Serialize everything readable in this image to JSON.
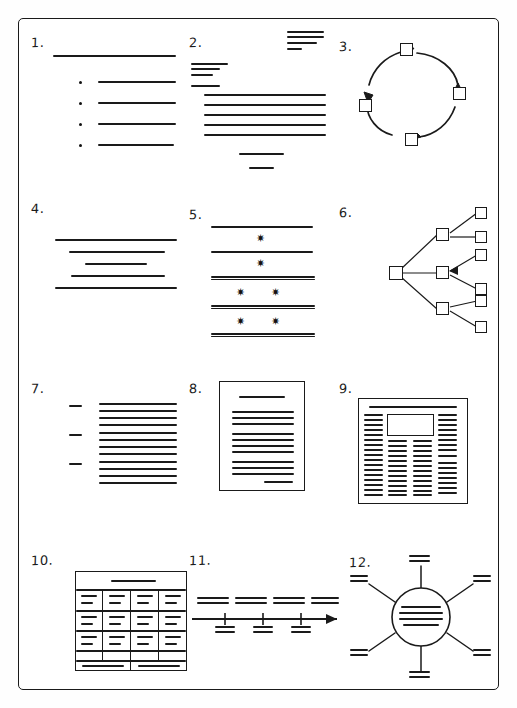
{
  "page": {
    "background_color": "#fefefe",
    "ink_color": "#1a1a1a",
    "frame": {
      "x": 18,
      "y": 18,
      "width": 481,
      "height": 672,
      "stroke": "#1a1a1a"
    }
  },
  "items": [
    {
      "id": 1,
      "number_label": "1.",
      "name": "bulleted-list-layout",
      "description": "Heading rule with four bulleted body lines",
      "bullet_count": 4
    },
    {
      "id": 2,
      "number_label": "2.",
      "name": "business-letter-layout",
      "description": "Letter with top-right address block, left sender block, body paragraph and closing signature lines",
      "top_right_lines": 4,
      "left_block_lines": 4,
      "body_lines": 5,
      "closing_lines": 2
    },
    {
      "id": 3,
      "number_label": "3.",
      "name": "cycle-diagram",
      "description": "Circular process cycle of four square nodes joined by curved arrows",
      "node_count": 4,
      "arrow_count": 4
    },
    {
      "id": 4,
      "number_label": "4.",
      "name": "centered-text-layout",
      "description": "Five centered lines of varying width forming an hourglass shape",
      "line_count": 5
    },
    {
      "id": 5,
      "number_label": "5.",
      "name": "starred-sections-layout",
      "description": "Horizontal divider rules separating rows marked with asterisk symbols",
      "divider_count": 5,
      "star_rows": [
        1,
        1,
        2,
        2
      ],
      "star_glyph": "✷"
    },
    {
      "id": 6,
      "number_label": "6.",
      "name": "tree-hierarchy-diagram",
      "description": "Root node branching to three middle nodes and six leaf nodes",
      "root_count": 1,
      "middle_count": 3,
      "leaf_count": 6
    },
    {
      "id": 7,
      "number_label": "7.",
      "name": "labeled-paragraph-layout",
      "description": "Three short side labels each aligned with a block of dense body text",
      "label_count": 3,
      "lines_per_block": 4
    },
    {
      "id": 8,
      "number_label": "8.",
      "name": "single-page-document",
      "description": "Bordered page with centered title, three paragraph blocks and a signature line at lower right",
      "paragraph_blocks": 3,
      "has_title_rule": true,
      "has_signature_rule": true
    },
    {
      "id": 9,
      "number_label": "9.",
      "name": "newspaper-layout",
      "description": "Masthead rule with a boxed image area and four dense text columns",
      "column_count": 4,
      "has_masthead": true,
      "has_image_box": true
    },
    {
      "id": 10,
      "number_label": "10.",
      "name": "table-layout",
      "description": "Table with a spanning header row, four columns by four data rows and a two-cell footer row",
      "columns": 4,
      "data_rows": 4,
      "header_row": true,
      "footer_cells": 2
    },
    {
      "id": 11,
      "number_label": "11.",
      "name": "timeline-diagram",
      "description": "Horizontal arrow timeline with tick marks and captions above and below the axis",
      "labels_above": 4,
      "ticks": 3,
      "labels_below": 3,
      "arrowhead": "right"
    },
    {
      "id": 12,
      "number_label": "12.",
      "name": "mind-map-diagram",
      "description": "Central circle containing text rules with eight radiating spokes ending in two-line captions",
      "spoke_count": 8,
      "center_lines": 4
    }
  ]
}
